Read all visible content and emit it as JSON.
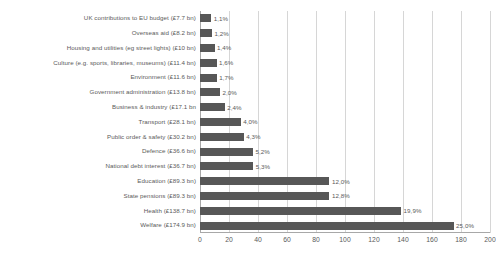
{
  "chart_data": {
    "type": "bar",
    "orientation": "horizontal",
    "title": "",
    "subtitle": "",
    "xlabel": "",
    "ylabel": "",
    "xlim": [
      0,
      200
    ],
    "xticks": [
      0,
      20,
      40,
      60,
      80,
      100,
      120,
      140,
      160,
      180,
      200
    ],
    "xtick_labels": [
      "0",
      "20",
      "40",
      "60",
      "80",
      "100",
      "120",
      "140",
      "160",
      "180",
      "200"
    ],
    "grid": true,
    "grid_axis": "x",
    "legend": false,
    "bar_color": "#575757",
    "gridline_color": "#d6d6d6",
    "axis_color": "#a8a8a8",
    "text_color": "#5a5a5a",
    "categories": [
      "UK contributions to EU budget (£7.7 bn)",
      "Overseas aid (£8.2 bn)",
      "Housing and utilities (eg street lights) (£10 bn)",
      "Culture (e.g. sports, libraries, museums) (£11.4 bn)",
      "Environment (£11.6 bn)",
      "Government administration (£13.8 bn)",
      "Business & industry (£17.1 bn",
      "Transport (£28.1 bn)",
      "Public order & safety (£30.2 bn)",
      "Defence (£36.6 bn)",
      "National debt interest (£36.7 bn)",
      "Education (£89.3 bn)",
      "State pensions (£89.3 bn)",
      "Health (£138.7 bn)",
      "Welfare (£174.9 bn)"
    ],
    "values": [
      7.7,
      8.2,
      10.0,
      11.4,
      11.6,
      13.8,
      17.1,
      28.1,
      30.2,
      36.6,
      36.7,
      89.3,
      89.3,
      138.7,
      174.9
    ],
    "data_labels": [
      "1,1%",
      "1,2%",
      "1,4%",
      "1,6%",
      "1,7%",
      "2,0%",
      "2,4%",
      "4,0%",
      "4,3%",
      "5,2%",
      "5,3%",
      "12,0%",
      "12,8%",
      "19,9%",
      "25,0%"
    ],
    "percentages": [
      1.1,
      1.2,
      1.4,
      1.6,
      1.7,
      2.0,
      2.4,
      4.0,
      4.3,
      5.2,
      5.3,
      12.0,
      12.8,
      19.9,
      25.0
    ]
  },
  "caption": {
    "text": ""
  }
}
